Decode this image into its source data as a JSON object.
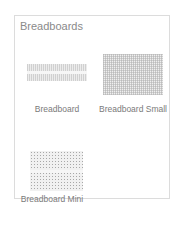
{
  "panel": {
    "title": "Breadboards",
    "items": [
      {
        "label": "Breadboard",
        "icon": "breadboard-full-icon"
      },
      {
        "label": "Breadboard Small",
        "icon": "breadboard-small-icon"
      },
      {
        "label": "Breadboard Mini",
        "icon": "breadboard-mini-icon"
      }
    ]
  }
}
